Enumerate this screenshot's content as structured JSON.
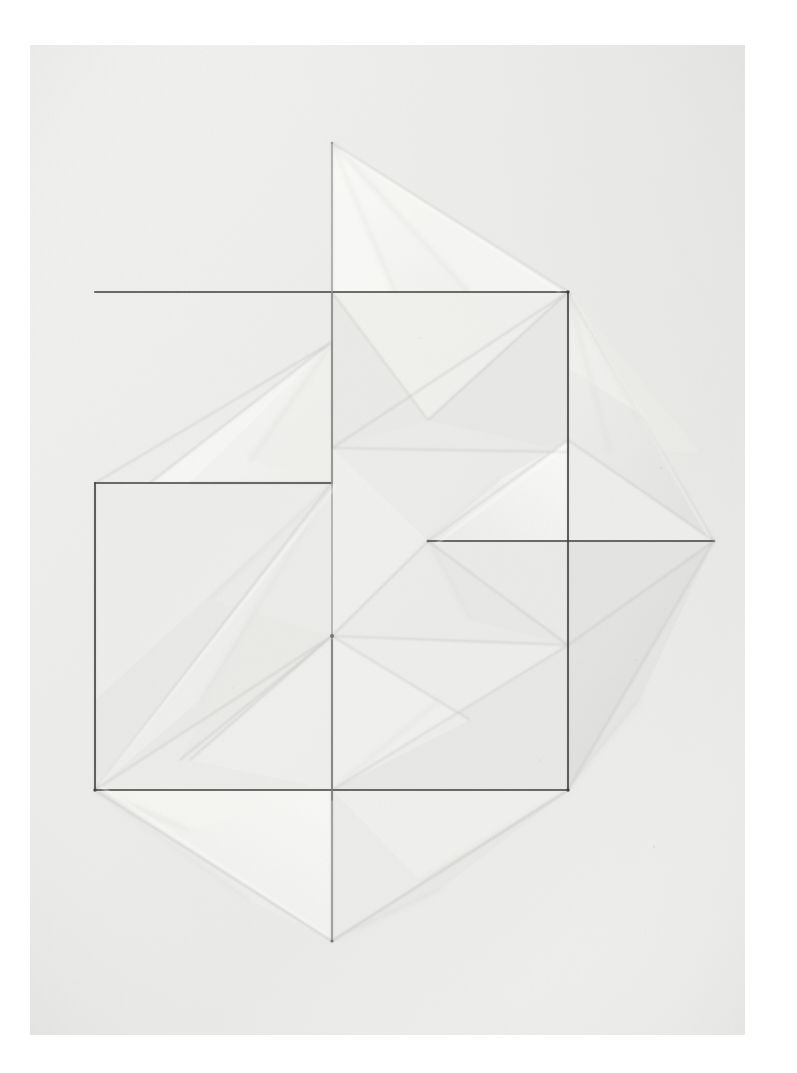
{
  "page": {
    "width": 797,
    "height": 1073,
    "background_color": "#ffffff"
  },
  "photo": {
    "name": "folded-paper-relief-photograph",
    "left": 30,
    "top": 45,
    "width": 715,
    "height": 990,
    "medium": "white paper, folded relief, graphite drawn lines",
    "paper_base_color": "#eeeeec",
    "paper_light_color": "#f7f7f5",
    "paper_shadow_color": "#d8d8d6",
    "graphite_color": "#3a3a3a",
    "crease_color": "#b9b9b7",
    "soft_crease_color": "#d2d2d0",
    "vignette_color": "#dedede"
  },
  "geometry": {
    "note": "Coordinates are in full-page pixel space (797 x 1073).",
    "center": {
      "x": 332,
      "y": 636
    },
    "top_apex": {
      "x": 332,
      "y": 143
    },
    "bottom_apex": {
      "x": 332,
      "y": 941
    },
    "right_tip": {
      "x": 714,
      "y": 541
    },
    "mid_left_node": {
      "x": 428,
      "y": 541
    },
    "drawn_lines": [
      {
        "id": "upper-horizontal",
        "x1": 95,
        "y1": 292,
        "x2": 568,
        "y2": 292,
        "weight": 1.6
      },
      {
        "id": "middle-horizontal",
        "x1": 95,
        "y1": 483,
        "x2": 332,
        "y2": 483,
        "weight": 1.3
      },
      {
        "id": "lower-horizontal",
        "x1": 95,
        "y1": 790,
        "x2": 568,
        "y2": 790,
        "weight": 1.6
      },
      {
        "id": "left-vertical",
        "x1": 95,
        "y1": 483,
        "x2": 95,
        "y2": 790,
        "weight": 1.6
      },
      {
        "id": "right-vertical",
        "x1": 568,
        "y1": 292,
        "x2": 568,
        "y2": 790,
        "weight": 1.6
      },
      {
        "id": "diamond-horizontal",
        "x1": 428,
        "y1": 541,
        "x2": 714,
        "y2": 541,
        "weight": 1.4
      },
      {
        "id": "center-vertical-upper",
        "x1": 332,
        "y1": 143,
        "x2": 332,
        "y2": 636,
        "weight": 1.1
      },
      {
        "id": "center-vertical-lower",
        "x1": 332,
        "y1": 636,
        "x2": 332,
        "y2": 941,
        "weight": 1.1
      }
    ],
    "square_outlines": [
      {
        "id": "upper-right-square",
        "x": 332,
        "y": 292,
        "w": 236,
        "h": 249
      },
      {
        "id": "lower-left-square",
        "x": 95,
        "y": 483,
        "w": 237,
        "h": 307
      }
    ]
  },
  "facets": {
    "legend": "Each facet is a folded paper plane; fill values are greyscale tones read off the photograph.",
    "tones": {
      "brightest": "#fbfbf9",
      "bright": "#f4f4f2",
      "base": "#ededeb",
      "mid": "#e6e6e4",
      "dim": "#dedede",
      "dark": "#d4d4d2",
      "darkest": "#c9c9c7"
    }
  },
  "annotations": {
    "top_triangle_label": "upper pleat wing",
    "right_diamond_label": "right diamond pocket",
    "left_fan_label": "left pleated fan",
    "bottom_fan_label": "lower pleated fan",
    "center_label": "central convergence point"
  }
}
